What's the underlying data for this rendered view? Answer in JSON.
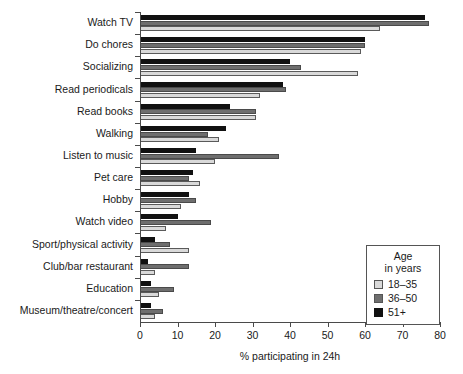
{
  "chart_data": {
    "type": "bar",
    "orientation": "horizontal",
    "title": "",
    "xlabel": "% participating in 24h",
    "ylabel": "",
    "xlim": [
      0,
      80
    ],
    "xticks": [
      0,
      10,
      20,
      30,
      40,
      50,
      60,
      70,
      80
    ],
    "grid": false,
    "legend_position": "inside-bottom-right",
    "legend_title": "Age in years",
    "legend_title_lines": [
      "Age",
      "in years"
    ],
    "categories": [
      "Watch TV",
      "Do chores",
      "Socializing",
      "Read periodicals",
      "Read books",
      "Walking",
      "Listen to music",
      "Pet care",
      "Hobby",
      "Watch video",
      "Sport/physical activity",
      "Club/bar restaurant",
      "Education",
      "Museum/theatre/concert"
    ],
    "series": [
      {
        "name": "18-35",
        "label": "18–35",
        "color": "#d9d9d9",
        "values": [
          64,
          59,
          58,
          32,
          31,
          21,
          20,
          16,
          11,
          7,
          13,
          4,
          5,
          4
        ]
      },
      {
        "name": "36-50",
        "label": "36–50",
        "color": "#6e6e6e",
        "values": [
          77,
          60,
          43,
          39,
          31,
          18,
          37,
          13,
          15,
          19,
          8,
          13,
          9,
          6
        ]
      },
      {
        "name": "51+",
        "label": "51+",
        "color": "#111111",
        "values": [
          76,
          60,
          40,
          38,
          24,
          23,
          15,
          14,
          13,
          10,
          4,
          2,
          3,
          3
        ]
      }
    ]
  },
  "axis": {
    "x_title": "% participating in 24h",
    "x_tick_labels": [
      "0",
      "10",
      "20",
      "30",
      "40",
      "50",
      "60",
      "70",
      "80"
    ]
  },
  "legend": {
    "title_line1": "Age",
    "title_line2": "in years",
    "items": [
      {
        "label": "18–35",
        "swatch": "light-gray-swatch"
      },
      {
        "label": "36–50",
        "swatch": "medium-gray-swatch"
      },
      {
        "label": "51+",
        "swatch": "black-swatch"
      }
    ]
  }
}
